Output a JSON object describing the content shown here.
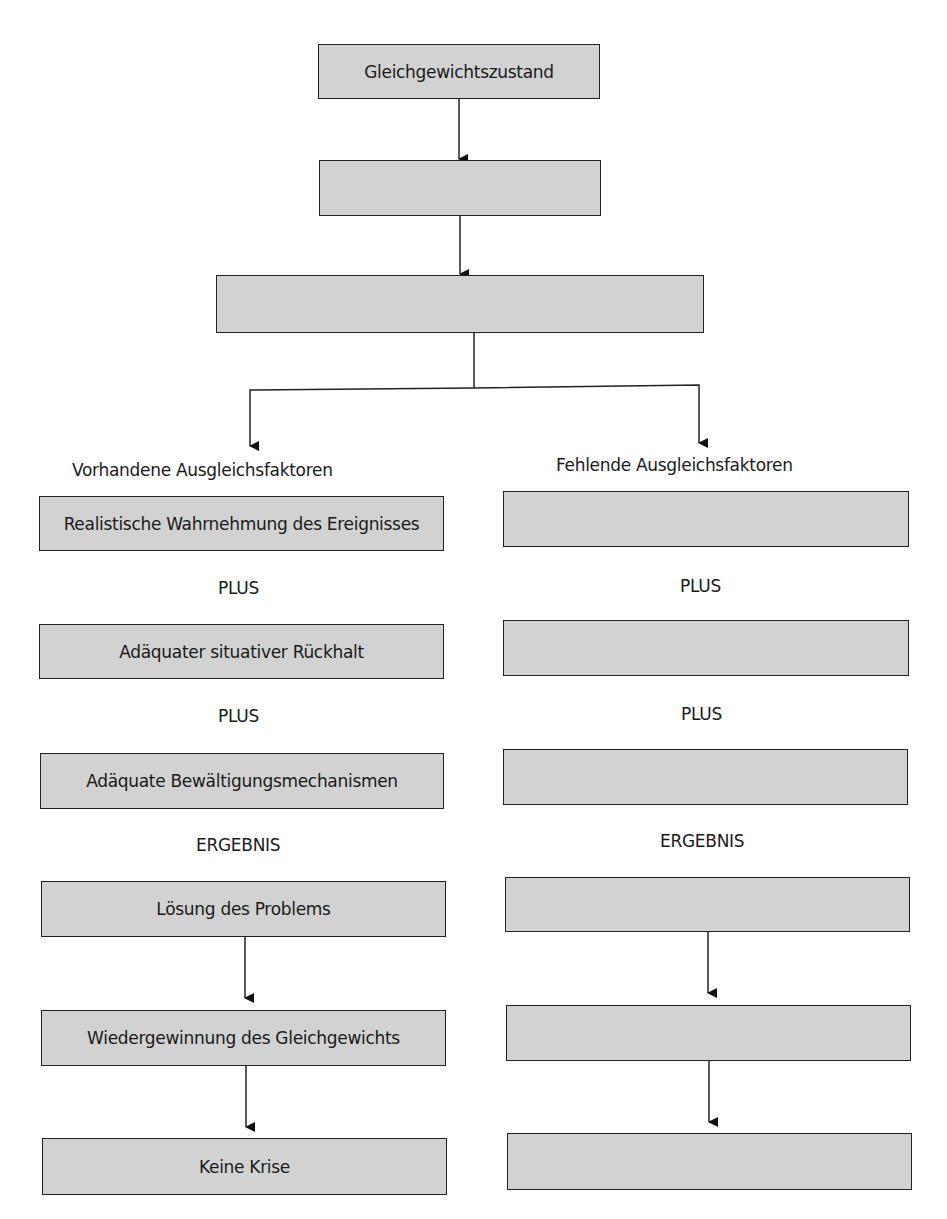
{
  "top": {
    "box1": "Gleichgewichtszustand",
    "box2": "",
    "box3": ""
  },
  "left": {
    "heading": "Vorhandene Ausgleichsfaktoren",
    "box1": "Realistische Wahrnehmung des Ereignisses",
    "plus1": "PLUS",
    "box2": "Adäquater situativer Rückhalt",
    "plus2": "PLUS",
    "box3": "Adäquate Bewältigungsmechanismen",
    "result": "ERGEBNIS",
    "box4": "Lösung des Problems",
    "box5": "Wiedergewinnung des Gleichgewichts",
    "box6": "Keine Krise"
  },
  "right": {
    "heading": "Fehlende Ausgleichsfaktoren",
    "box1": "",
    "plus1": "PLUS",
    "box2": "",
    "plus2": "PLUS",
    "box3": "",
    "result": "ERGEBNIS",
    "box4": "",
    "box5": "",
    "box6": ""
  },
  "colors": {
    "box_fill": "#d2d2d2",
    "stroke": "#222222"
  }
}
